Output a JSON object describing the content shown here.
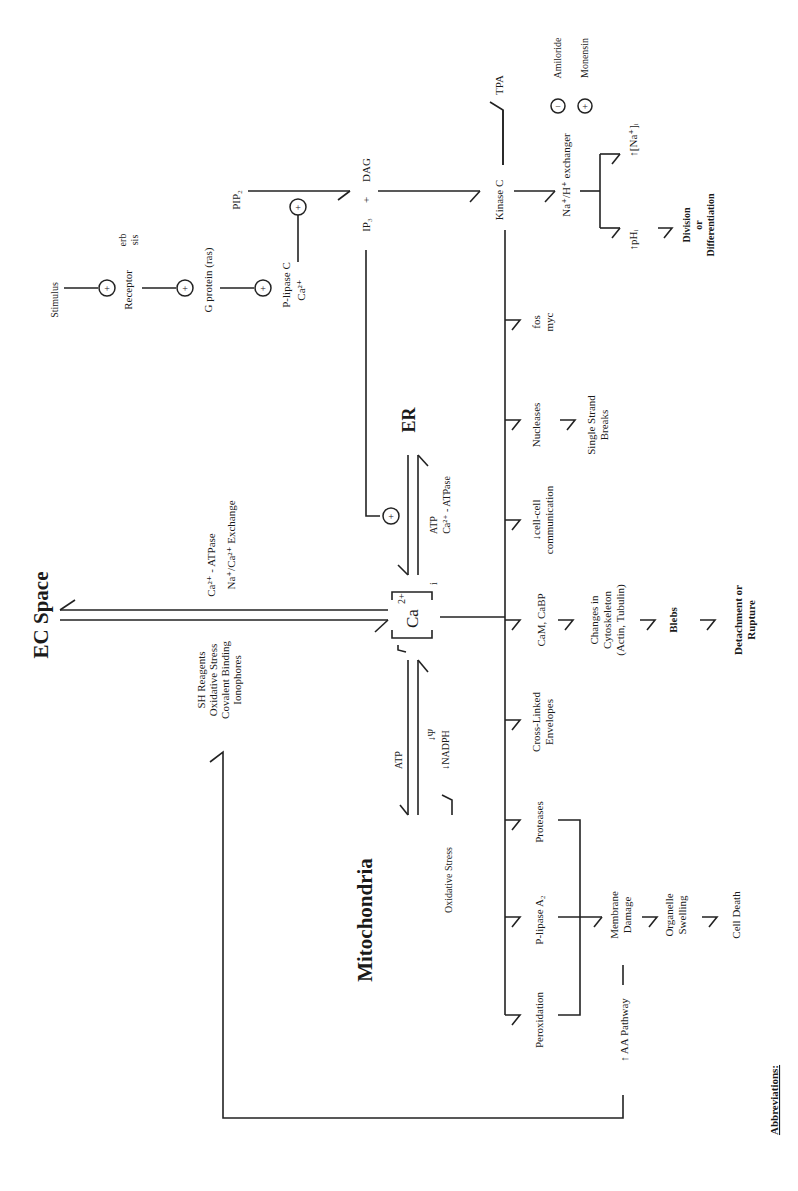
{
  "figure": {
    "orientation": "rotated-90-ccw",
    "compartments": {
      "ec_space": "EC Space",
      "er": "ER",
      "mitochondria": "Mitochondria",
      "calcium_center": {
        "base": "Ca",
        "charge": "2+",
        "subscript": "i"
      }
    },
    "signal_chain": {
      "stimulus": "Stimulus",
      "receptor": "Receptor",
      "receptor_oncogenes": [
        "erb",
        "sis"
      ],
      "g_protein": "G protein (ras)",
      "p_lipase_c": "P-lipase C",
      "p_lipase_c_cofactor": "Ca²⁺",
      "pip2": "PIP₂",
      "ip3": "IP₃",
      "plus": "+",
      "dag": "DAG",
      "kinase_c": "Kinase C",
      "tpa": "TPA",
      "exchanger": "Na⁺/H⁺ exchanger",
      "inhibitor": {
        "symbol": "−",
        "label": "Amiloride"
      },
      "activator": {
        "symbol": "+",
        "label": "Monensin"
      },
      "ph_increase": "↑pHᵢ",
      "na_increase": "↑[Na⁺]ᵢ",
      "outcome_lines": [
        "Division",
        "or",
        "Differentiation"
      ]
    },
    "ec_exchange": {
      "efflux_lines": [
        "Ca²⁺ - ATPase",
        "Na⁺/Ca²⁺ Exchange"
      ],
      "influx_lines": [
        "SH Reagents",
        "Oxidative Stress",
        "Covalent Binding",
        "Ionophores"
      ]
    },
    "er_exchange": {
      "lines": [
        "ATP",
        "Ca²⁺ - ATPase"
      ]
    },
    "mito_exchange": {
      "atp": "ATP",
      "psi": "↓Ψ",
      "nadph": "↓NADPH",
      "oxidative_stress": "Oxidative Stress"
    },
    "increase_marker": "↑",
    "targets": [
      {
        "label_lines": [
          "Peroxidation"
        ]
      },
      {
        "label_lines": [
          "P-lipase A₂"
        ]
      },
      {
        "label_lines": [
          "Proteases"
        ]
      },
      {
        "label_lines": [
          "Cross-Linked",
          "Envelopes"
        ]
      },
      {
        "label_lines": [
          "CaM, CaBP"
        ]
      },
      {
        "label_lines": [
          "↓cell-cell",
          "communication"
        ]
      },
      {
        "label_lines": [
          "Nucleases"
        ]
      },
      {
        "label_lines": [
          "fos",
          "myc"
        ]
      }
    ],
    "downstream": {
      "cytoskeleton_lines": [
        "Changes in",
        "Cytoskeleton",
        "(Actin, Tubulin)"
      ],
      "blebs": "Blebs",
      "rupture_lines": [
        "Detachment or",
        "Rupture"
      ],
      "strand_breaks_lines": [
        "Single Strand",
        "Breaks"
      ],
      "membrane_lines": [
        "Membrane",
        "Damage"
      ],
      "organelle_lines": [
        "Organelle",
        "Swelling"
      ],
      "cell_death": "Cell Death",
      "aa_pathway": "↑ AA Pathway"
    },
    "abbreviations_heading": "Abbreviations:"
  }
}
